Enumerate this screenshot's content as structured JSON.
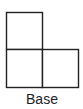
{
  "diagram": {
    "label": "Base",
    "stroke_color": "#222222",
    "fill_color": "#ffffff",
    "cells": [
      {
        "id": "top-left",
        "x": 6.5,
        "y": 12.5,
        "width": 36,
        "height": 37
      },
      {
        "id": "bottom-left",
        "x": 6.5,
        "y": 49.5,
        "width": 36,
        "height": 38
      },
      {
        "id": "bottom-right",
        "x": 42.5,
        "y": 49.5,
        "width": 36,
        "height": 38
      }
    ]
  }
}
